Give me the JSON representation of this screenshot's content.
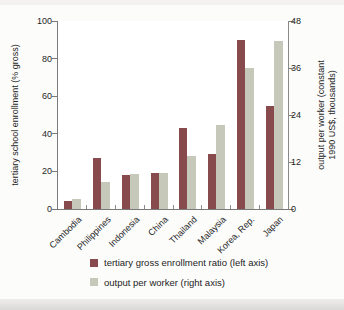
{
  "chart_data": {
    "type": "bar",
    "categories": [
      "Cambodia",
      "Philippines",
      "Indonesia",
      "China",
      "Thailand",
      "Malaysia",
      "Korea, Rep.",
      "Japan"
    ],
    "series": [
      {
        "name": "tertiary gross enrollment ratio (left axis)",
        "axis": "left",
        "color": "#874b4d",
        "values": [
          4,
          27,
          18,
          19,
          43,
          29,
          90,
          55
        ]
      },
      {
        "name": "output per worker (right axis)",
        "axis": "right",
        "color": "#c6c8ba",
        "values": [
          2.5,
          7,
          9,
          9.3,
          13.5,
          21.5,
          36,
          43
        ]
      }
    ],
    "left_axis": {
      "label": "tertiary school enrollment (% gross)",
      "ticks": [
        0,
        20,
        40,
        60,
        80,
        100
      ],
      "range": [
        0,
        100
      ]
    },
    "right_axis": {
      "label_line1": "output per worker (constant",
      "label_line2": "1990 US$, thousands)",
      "ticks": [
        0,
        12,
        24,
        36,
        48
      ],
      "range": [
        0,
        48
      ]
    },
    "grid": false,
    "legend_position": "bottom"
  }
}
